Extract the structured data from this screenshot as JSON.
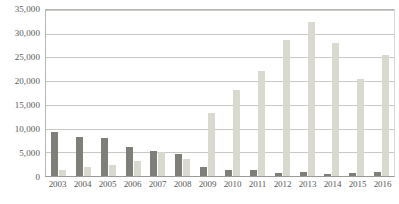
{
  "chart_data": {
    "type": "bar",
    "title": "",
    "subtitle": "",
    "xlabel": "",
    "ylabel": "",
    "ylim": [
      0,
      35000
    ],
    "ytick_labels": [
      "35,000",
      "30,000",
      "25,000",
      "20,000",
      "15,000",
      "10,000",
      "5,000",
      "0"
    ],
    "ytick_values": [
      35000,
      30000,
      25000,
      20000,
      15000,
      10000,
      5000,
      0
    ],
    "grid": true,
    "legend_position": "none",
    "categories": [
      "2003",
      "2004",
      "2005",
      "2006",
      "2007",
      "2008",
      "2009",
      "2010",
      "2011",
      "2012",
      "2013",
      "2014",
      "2015",
      "2016"
    ],
    "series": [
      {
        "name": "series-1",
        "color": "#7f7f79",
        "values": [
          9300,
          8200,
          8000,
          6200,
          5200,
          4700,
          1900,
          1200,
          1300,
          700,
          800,
          500,
          600,
          900
        ]
      },
      {
        "name": "series-2",
        "color": "#d9d9cf",
        "values": [
          1300,
          1800,
          2300,
          3200,
          5100,
          3600,
          13200,
          18100,
          22100,
          28700,
          32500,
          28000,
          20500,
          25500
        ]
      }
    ]
  }
}
